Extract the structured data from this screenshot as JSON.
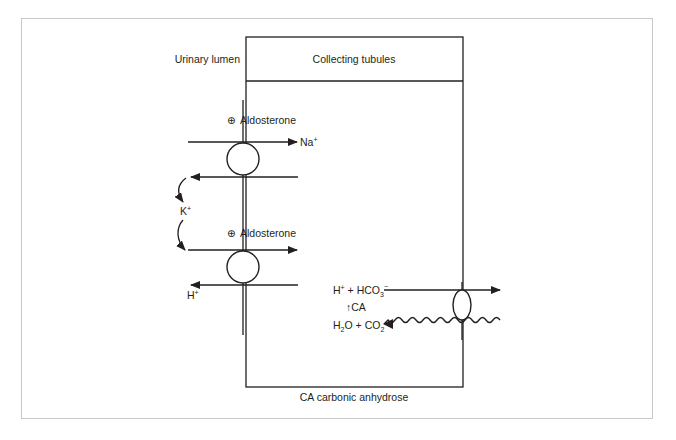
{
  "diagram": {
    "labels": {
      "urinary_lumen": "Urinary lumen",
      "collecting_tubules": "Collecting tubules",
      "aldosterone_1": "Aldosterone",
      "aldosterone_2": "Aldosterone",
      "plus_symbol": "⊕",
      "na": "Na",
      "na_charge": "+",
      "k": "K",
      "k_charge": "+",
      "h_left": "H",
      "h_left_charge": "+",
      "reaction_top": "H⁺ + HCO₃⁻",
      "reaction_top_h": "H",
      "reaction_top_h_charge": "+",
      "reaction_top_plus": " + HCO",
      "reaction_top_sub": "3",
      "reaction_top_charge": "−",
      "ca_arrow": "↑CA",
      "reaction_bottom_h": "H",
      "reaction_bottom_sub1": "2",
      "reaction_bottom_mid": "O + CO",
      "reaction_bottom_sub2": "2",
      "caption": "CA carbonic anhydrose"
    },
    "colors": {
      "stroke": "#231f20",
      "frame": "#c9c9c9",
      "background": "#ffffff"
    }
  }
}
